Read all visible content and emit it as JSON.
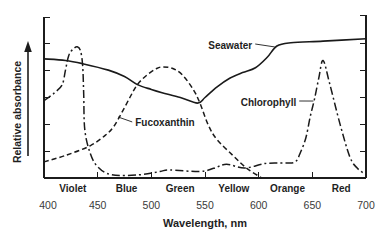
{
  "chart_data": {
    "type": "line",
    "title": "",
    "xlabel": "Wavelength, nm",
    "ylabel": "Relative absorbance",
    "xlim": [
      400,
      700
    ],
    "ylim": [
      0,
      1
    ],
    "xticks": [
      400,
      450,
      500,
      550,
      600,
      650,
      700
    ],
    "xtick_labels": [
      "400",
      "450",
      "500",
      "550",
      "600",
      "650",
      "700"
    ],
    "yticks_unlabeled": [
      0.1667,
      0.3333,
      0.5,
      0.6667,
      0.8333,
      1.0
    ],
    "grid": false,
    "legend": "none (curves labeled directly)",
    "color_bands": [
      {
        "label": "Violet",
        "range": [
          400,
          450
        ]
      },
      {
        "label": "Blue",
        "range": [
          450,
          500
        ]
      },
      {
        "label": "Green",
        "range": [
          500,
          550
        ]
      },
      {
        "label": "Yellow",
        "range": [
          550,
          600
        ]
      },
      {
        "label": "Orange",
        "range": [
          600,
          650
        ]
      },
      {
        "label": "Red",
        "range": [
          650,
          700
        ]
      }
    ],
    "series": [
      {
        "name": "Seawater",
        "style": "solid",
        "points": [
          [
            400,
            0.74
          ],
          [
            420,
            0.73
          ],
          [
            436,
            0.71
          ],
          [
            460,
            0.67
          ],
          [
            475,
            0.63
          ],
          [
            487,
            0.58
          ],
          [
            500,
            0.55
          ],
          [
            510,
            0.53
          ],
          [
            527,
            0.5
          ],
          [
            543,
            0.465
          ],
          [
            550,
            0.5
          ],
          [
            561,
            0.565
          ],
          [
            573,
            0.62
          ],
          [
            585,
            0.655
          ],
          [
            597,
            0.685
          ],
          [
            608,
            0.75
          ],
          [
            617,
            0.82
          ],
          [
            630,
            0.84
          ],
          [
            660,
            0.85
          ],
          [
            700,
            0.865
          ]
        ]
      },
      {
        "name": "Fucoxanthin",
        "style": "dashed",
        "points": [
          [
            400,
            0.1
          ],
          [
            420,
            0.14
          ],
          [
            443,
            0.2
          ],
          [
            458,
            0.27
          ],
          [
            465,
            0.32
          ],
          [
            472,
            0.4
          ],
          [
            480,
            0.5
          ],
          [
            487,
            0.58
          ],
          [
            496,
            0.64
          ],
          [
            505,
            0.68
          ],
          [
            511,
            0.69
          ],
          [
            520,
            0.68
          ],
          [
            529,
            0.64
          ],
          [
            539,
            0.55
          ],
          [
            545,
            0.47
          ],
          [
            553,
            0.33
          ],
          [
            561,
            0.24
          ],
          [
            576,
            0.14
          ],
          [
            589,
            0.06
          ],
          [
            603,
            0.0
          ]
        ]
      },
      {
        "name": "Chlorophyll",
        "style": "dash-dot",
        "points": [
          [
            400,
            0.48
          ],
          [
            410,
            0.53
          ],
          [
            417,
            0.58
          ],
          [
            420,
            0.67
          ],
          [
            423,
            0.76
          ],
          [
            427,
            0.8
          ],
          [
            431,
            0.815
          ],
          [
            434,
            0.79
          ],
          [
            436,
            0.7
          ],
          [
            437,
            0.52
          ],
          [
            438,
            0.3
          ],
          [
            443,
            0.155
          ],
          [
            450,
            0.07
          ],
          [
            463,
            0.02
          ],
          [
            489,
            0.02
          ],
          [
            508,
            0.04
          ],
          [
            517,
            0.05
          ],
          [
            545,
            0.04
          ],
          [
            558,
            0.06
          ],
          [
            570,
            0.085
          ],
          [
            587,
            0.062
          ],
          [
            606,
            0.09
          ],
          [
            624,
            0.093
          ],
          [
            634,
            0.1
          ],
          [
            639,
            0.16
          ],
          [
            644,
            0.25
          ],
          [
            648,
            0.38
          ],
          [
            652,
            0.49
          ],
          [
            656,
            0.62
          ],
          [
            660,
            0.73
          ],
          [
            666,
            0.59
          ],
          [
            676,
            0.33
          ],
          [
            685,
            0.13
          ],
          [
            692,
            0.06
          ],
          [
            700,
            0.02
          ]
        ]
      }
    ],
    "annotations": [
      {
        "text": "Seawater",
        "series": "Seawater",
        "text_at": [
          594,
          0.826
        ],
        "align": "end",
        "points_to": [
          615,
          0.814
        ]
      },
      {
        "text": "Chlorophyll",
        "series": "Chlorophyll",
        "text_at": [
          635,
          0.472
        ],
        "align": "end",
        "points_to": [
          651,
          0.478
        ]
      },
      {
        "text": "Fucoxanthin",
        "series": "Fucoxanthin",
        "text_at": [
          485,
          0.342
        ],
        "align": "start",
        "points_to": [
          469,
          0.379
        ]
      }
    ]
  }
}
